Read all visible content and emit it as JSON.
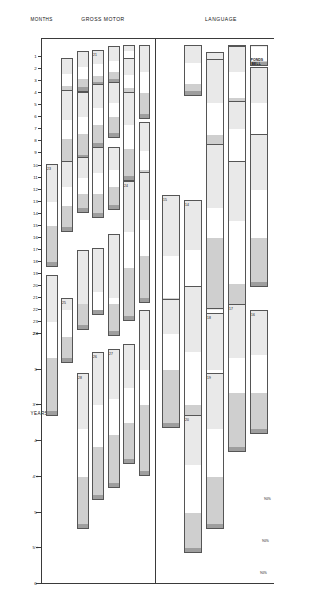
{
  "chart_data": {
    "type": "bar",
    "xlabel_left": "MONTHS",
    "xlabel_right": "YEARS",
    "rows": [
      "LANGUAGE",
      "GROSS MOTOR"
    ],
    "percentile_legend": [
      "25%",
      "50%",
      "75%",
      "90%"
    ],
    "axis": {
      "month_ticks": [
        "1",
        "2",
        "3",
        "4",
        "5",
        "6",
        "7",
        "8",
        "9",
        "10",
        "11",
        "12",
        "13",
        "14",
        "15",
        "16",
        "17",
        "18",
        "19",
        "20",
        "21",
        "22",
        "23",
        "24"
      ],
      "year_ticks": [
        "2½",
        "3",
        "3½",
        "4",
        "4½",
        "5",
        "5½",
        "6"
      ]
    },
    "percentile_callouts": [
      "90%",
      "90%",
      "90%"
    ],
    "language": [
      {
        "n": "",
        "label": "RESPONDS\nTO BELL",
        "bold": true
      },
      {
        "n": "",
        "label": "VOCALIZES\nNOT\nCRYING"
      },
      {
        "n": "",
        "label": "LAUGHS"
      },
      {
        "n": "",
        "label": "SQUEALS"
      },
      {
        "n": "",
        "label": "TURNS TO VOICE"
      },
      {
        "n": "",
        "label": "DADA OR MAMA,\nNONSPECIFIC"
      },
      {
        "n": "",
        "label": "IMITATES SPEECH SOUNDS"
      },
      {
        "n": "",
        "label": "DAD OR MAMA,\nSPECIFIC"
      },
      {
        "n": "",
        "label": "3 WORDS OTHER THAN MAMA, DADA"
      },
      {
        "n": "",
        "label": "COMBINES 2 DIFFERENT WORDS"
      },
      {
        "n": "",
        "label": "POINTS TO 1 NAMED\nBODY PART"
      },
      {
        "n": "14",
        "label": "NAMES 1 PICTURE"
      },
      {
        "n": "15",
        "label": "FOLLOWS DIRECTIONS 2 of 3"
      },
      {
        "n": "",
        "label": "USES PLURALS"
      },
      {
        "n": "16",
        "label": "COMPREHENDS\nCOLD,\nTIRED, HUNGRY of 3",
        "bold": true
      },
      {
        "n": "17",
        "label": "COMPREHENDS\nPREPOSITIONS of 4",
        "bold": true
      },
      {
        "n": "18",
        "label": "RECOGNIZES COLORS of 4"
      },
      {
        "n": "",
        "label": "OPPOSITE ANALOGIES\n2 of 3"
      },
      {
        "n": "",
        "label": "USES 1ST &\nLAST NAME"
      },
      {
        "n": "19",
        "label": "DEFINES WORDS of 9"
      },
      {
        "n": "20",
        "label": "COMPOSITION of 3"
      }
    ],
    "gross_motor": [
      {
        "n": "",
        "label": "STO LIFTS\nHEAD",
        "bold": true
      },
      {
        "n": "",
        "label": "STO HEAD UP 45°"
      },
      {
        "n": "",
        "label": "STO HEAD\nUP 90°"
      },
      {
        "n": "21",
        "label": "STO CHEST UP\nARM SUPPORT",
        "bold": true
      },
      {
        "n": "",
        "label": "SIT HEAD\nSTEADY"
      },
      {
        "n": "",
        "label": "BEAR SOME WEIGHT ON LEGS"
      },
      {
        "n": "",
        "label": "PULL TO SIT\nNO HEAD LAG"
      },
      {
        "n": "",
        "label": "ROLLS OVER"
      },
      {
        "n": "",
        "label": "SITS WITHOUT\nSUPPORT"
      },
      {
        "n": "",
        "label": "STANDS HOLDING ON"
      },
      {
        "n": "",
        "label": "PULLS SELF TO STAND"
      },
      {
        "n": "",
        "label": "GETS TO SITTING"
      },
      {
        "n": "",
        "label": "STANDS MOMENTARILY"
      },
      {
        "n": "",
        "label": "WALKS HOLDING ON FURNITURE"
      },
      {
        "n": "",
        "label": "STANDS ALONE WELL"
      },
      {
        "n": "",
        "label": "STOOPS & RECOVERS"
      },
      {
        "n": "",
        "label": "WALKS WELL"
      },
      {
        "n": "",
        "label": "WALKS BACKWARDS"
      },
      {
        "n": "23",
        "label": "WALKS UP STEPS"
      },
      {
        "n": "",
        "label": "KICKS BALL FORWARD"
      },
      {
        "n": "24",
        "label": "THROWS BALL OVERHAND"
      },
      {
        "n": "",
        "label": "BALANCE ON 1 FOOT\n1 SECOND"
      },
      {
        "n": "",
        "label": "JUMPS IN PLACE"
      },
      {
        "n": "",
        "label": "PEDALS TRICYCLE"
      },
      {
        "n": "25",
        "label": "BROAD JUMP"
      },
      {
        "n": "",
        "label": "BALANCE ON 1 FOOT\n5 SECONDS of 3"
      },
      {
        "n": "",
        "label": "BALANCE ON 1 FOOT\n10 SECONDS of 3"
      },
      {
        "n": "",
        "label": "HOPS ON 1 FOOT"
      },
      {
        "n": "27",
        "label": "CATCHES BOUNCED\nBALL 2 of 3"
      },
      {
        "n": "26",
        "label": "HEEL TO TOE WALK 2 of 3"
      },
      {
        "n": "28",
        "label": "BACKWARD\nHEEL-TOE 2 of 3"
      }
    ]
  }
}
